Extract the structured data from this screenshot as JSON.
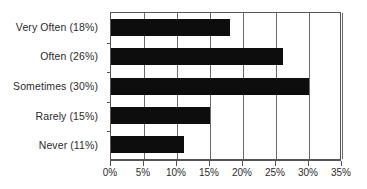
{
  "chart_data": {
    "type": "bar",
    "orientation": "horizontal",
    "title": "",
    "xlabel": "",
    "ylabel": "",
    "categories": [
      "Very Often (18%)",
      "Often (26%)",
      "Sometimes (30%)",
      "Rarely (15%)",
      "Never (11%)"
    ],
    "category_names": [
      "Very Often",
      "Often",
      "Sometimes",
      "Rarely",
      "Never"
    ],
    "values": [
      18,
      26,
      30,
      15,
      11
    ],
    "value_unit": "%",
    "xlim": [
      0,
      35
    ],
    "xticks": [
      0,
      5,
      10,
      15,
      20,
      25,
      30,
      35
    ],
    "xtick_labels": [
      "0%",
      "5%",
      "10%",
      "15%",
      "20%",
      "25%",
      "30%",
      "35%"
    ],
    "grid": "vertical",
    "legend": "none",
    "bar_color": "#0d0d0d",
    "axis_color": "#555555",
    "grid_color": "#6a6a6a",
    "background": "#ffffff"
  }
}
